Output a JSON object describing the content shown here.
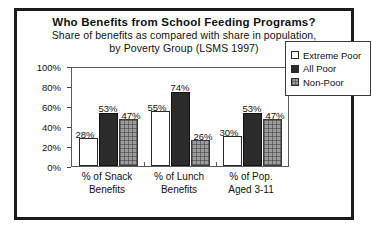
{
  "chart_data": {
    "type": "bar",
    "title": "Who Benefits from School Feeding Programs?",
    "subtitle_line1": "Share of benefits as compared with share in population,",
    "subtitle_line2": "by Poverty Group (LSMS 1997)",
    "xlabel": "",
    "ylabel": "",
    "ylim": [
      0,
      100
    ],
    "ytick_labels": [
      "100%",
      "80%",
      "60%",
      "40%",
      "20%",
      "0%"
    ],
    "ytick_values": [
      100,
      80,
      60,
      40,
      20,
      0
    ],
    "grid": false,
    "legend_position": "right",
    "categories": [
      "% of Snack Benefits",
      "% of Lunch Benefits",
      "% of Pop. Aged 3-11"
    ],
    "category_lines": [
      [
        "% of Snack",
        "Benefits"
      ],
      [
        "% of Lunch",
        "Benefits"
      ],
      [
        "% of Pop.",
        "Aged 3-11"
      ]
    ],
    "series": [
      {
        "name": "Extreme Poor",
        "values": [
          28,
          55,
          30
        ],
        "labels": [
          "28%",
          "55%",
          "30%"
        ],
        "color": "#ffffff"
      },
      {
        "name": "All Poor",
        "values": [
          53,
          74,
          53
        ],
        "labels": [
          "53%",
          "74%",
          "53%"
        ],
        "color": "#2b2b2b"
      },
      {
        "name": "Non-Poor",
        "values": [
          47,
          26,
          47
        ],
        "labels": [
          "47%",
          "26%",
          "47%"
        ],
        "color": "#9d9d9d"
      }
    ]
  },
  "legend": {
    "items": [
      {
        "label": "Extreme Poor"
      },
      {
        "label": "All Poor"
      },
      {
        "label": "Non-Poor"
      }
    ]
  }
}
